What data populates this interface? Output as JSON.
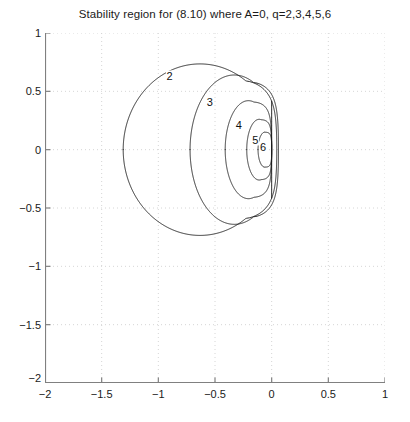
{
  "figure": {
    "title": "Stability region for (8.10) where A=0, q=2,3,4,5,6",
    "background": "#ffffff",
    "axis_color": "#808080",
    "grid_color": "#cccccc",
    "curve_color": "#1a1a1a"
  },
  "chart_data": {
    "type": "line",
    "title": "Stability region for (8.10) where A=0, q=2,3,4,5,6",
    "xlabel": "",
    "ylabel": "",
    "xlim": [
      -2,
      1
    ],
    "ylim": [
      -2,
      1
    ],
    "xticks": [
      -2,
      -1.5,
      -1,
      -0.5,
      0,
      0.5,
      1
    ],
    "xticklabels": [
      "-2",
      "-1.5",
      "-1",
      "-0.5",
      "0",
      "0.5",
      "1"
    ],
    "yticks": [
      -2,
      -1.5,
      -1,
      -0.5,
      0,
      0.5,
      1
    ],
    "yticklabels": [
      "-2",
      "-1.5",
      "-1",
      "-0.5",
      "0",
      "0.5",
      "1"
    ],
    "grid": true,
    "grid_style": "dotted",
    "legend": "none",
    "annotations": [
      {
        "text": "2",
        "x": -0.9,
        "y": 0.63
      },
      {
        "text": "3",
        "x": -0.545,
        "y": 0.405
      },
      {
        "text": "4",
        "x": -0.29,
        "y": 0.215
      },
      {
        "text": "5",
        "x": -0.145,
        "y": 0.085
      },
      {
        "text": "6",
        "x": -0.075,
        "y": 0.02
      }
    ],
    "series": [
      {
        "name": "q=2",
        "label": "2",
        "description": "outermost closed stability boundary, leftmost extent near x=-1.31, crosses x=0 near y=+-0.72",
        "x_extent": [
          -1.31,
          0.04
        ],
        "y_extent": [
          -0.74,
          0.74
        ]
      },
      {
        "name": "q=3",
        "label": "3",
        "description": "second closed boundary, leftmost extent near x=-0.72",
        "x_extent": [
          -0.72,
          0.06
        ],
        "y_extent": [
          -0.64,
          0.64
        ]
      },
      {
        "name": "q=4",
        "label": "4",
        "description": "third closed boundary terminating on the vertical line x=0",
        "x_extent": [
          -0.41,
          0.0
        ],
        "y_extent": [
          -0.42,
          0.42
        ]
      },
      {
        "name": "q=5",
        "label": "5",
        "description": "fourth closed boundary terminating on the vertical line x=0",
        "x_extent": [
          -0.22,
          0.0
        ],
        "y_extent": [
          -0.26,
          0.26
        ]
      },
      {
        "name": "q=6",
        "label": "6",
        "description": "innermost closed boundary terminating on the vertical line x=0",
        "x_extent": [
          -0.12,
          0.0
        ],
        "y_extent": [
          -0.15,
          0.15
        ]
      }
    ]
  }
}
